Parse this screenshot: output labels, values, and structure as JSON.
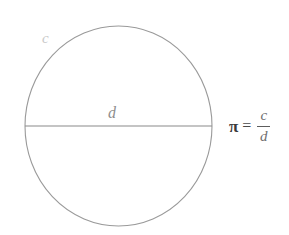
{
  "figure": {
    "background_color": "#ffffff",
    "width": 289,
    "height": 235
  },
  "diagram": {
    "shape": "circle",
    "circle": {
      "center_x": 118.5,
      "center_y": 126,
      "radius_x": 93.5,
      "radius_y": 100,
      "stroke_color": "#9a9a9a",
      "stroke_width": 1.1,
      "fill": "none"
    },
    "diameter_line": {
      "x1": 25,
      "y1": 126,
      "x2": 212,
      "y2": 126,
      "stroke_color": "#8a8a8a",
      "stroke_width": 1.2
    }
  },
  "labels": {
    "circumference": {
      "text": "c",
      "color": "#c9c9c9",
      "meaning": "circumference"
    },
    "diameter": {
      "text": "d",
      "color": "#8e8e8e",
      "meaning": "diameter"
    }
  },
  "equation": {
    "symbol": "π",
    "equals": "=",
    "numerator": "c",
    "denominator": "d",
    "symbol_color": "#3b3b3b",
    "fraction_color": "#6f6f6f"
  }
}
